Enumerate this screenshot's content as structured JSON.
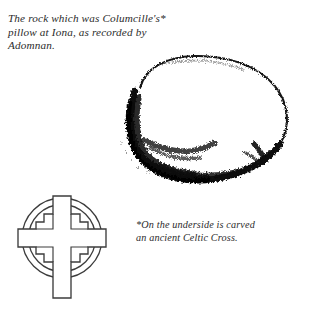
{
  "page": {
    "background_color": "#ffffff",
    "ink_color": "#1a1a1a"
  },
  "captions": {
    "main": "The rock which was Columcille's*\npillow at Iona, as recorded by\nAdomnan.",
    "note": "*On the underside is carved\nan ancient Celtic Cross."
  },
  "illustrations": {
    "rock": {
      "name": "rock-illustration",
      "description": "Pen and ink drawing of a rounded boulder with heavy stippled shading along the lower and left edges",
      "outline_color": "#111111",
      "fill_color": "#ffffff"
    },
    "cross": {
      "name": "celtic-cross-illustration",
      "description": "Line drawing of a stepped Celtic ring cross with two concentric circles",
      "line_color": "#3a3a3a",
      "fill_color": "#ffffff",
      "ring_count": 2
    }
  }
}
